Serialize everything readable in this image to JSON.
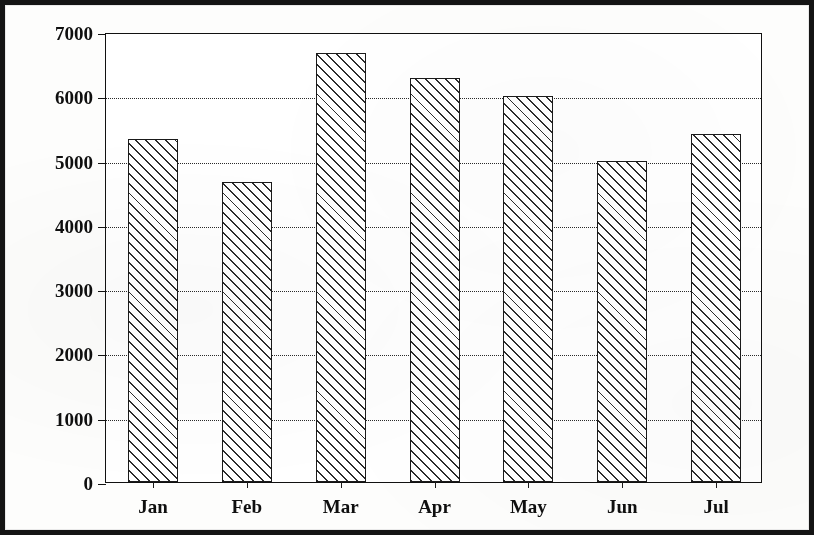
{
  "chart_data": {
    "type": "bar",
    "title": "",
    "title_note": "title row is cropped off the top edge of the scan",
    "xlabel": "",
    "ylabel": "",
    "categories": [
      "Jan",
      "Feb",
      "Mar",
      "Apr",
      "May",
      "Jun",
      "Jul"
    ],
    "values": [
      5330,
      4670,
      6670,
      6280,
      6010,
      4990,
      5420
    ],
    "series": [
      {
        "name": "",
        "values": [
          5330,
          4670,
          6670,
          6280,
          6010,
          4990,
          5420
        ]
      }
    ],
    "ylim": [
      0,
      7000
    ],
    "ytick_labels": [
      "0",
      "1000",
      "2000",
      "3000",
      "4000",
      "5000",
      "6000",
      "7000"
    ],
    "ytick_values": [
      0,
      1000,
      2000,
      3000,
      4000,
      5000,
      6000,
      7000
    ],
    "ytick_step": 1000,
    "grid": true,
    "grid_axis": "y",
    "grid_style": "dotted",
    "legend": false,
    "legend_position": "none",
    "bar_fill": "diagonal-hatch",
    "colors": {
      "bar_edge": "#1a1a1a",
      "bar_hatch": "#2b2b2b",
      "bar_face": "#ffffff",
      "axis": "#111111",
      "grid": "#2a2a2a",
      "text": "#0f0f0f",
      "page_border": "#141414",
      "background": "#ffffff"
    },
    "annotations": []
  },
  "axes": {
    "y": {
      "ticks": [
        {
          "label": "7000",
          "value": 7000
        },
        {
          "label": "6000",
          "value": 6000
        },
        {
          "label": "5000",
          "value": 5000
        },
        {
          "label": "4000",
          "value": 4000
        },
        {
          "label": "3000",
          "value": 3000
        },
        {
          "label": "2000",
          "value": 2000
        },
        {
          "label": "1000",
          "value": 1000
        },
        {
          "label": "0",
          "value": 0
        }
      ]
    },
    "x": {
      "ticks": [
        {
          "label": "Jan"
        },
        {
          "label": "Feb"
        },
        {
          "label": "Mar"
        },
        {
          "label": "Apr"
        },
        {
          "label": "May"
        },
        {
          "label": "Jun"
        },
        {
          "label": "Jul"
        }
      ]
    }
  }
}
